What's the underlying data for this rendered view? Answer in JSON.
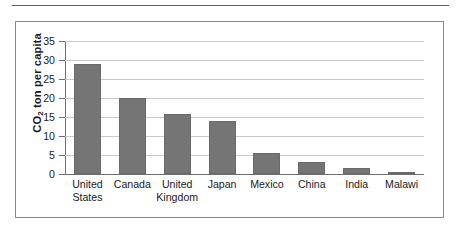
{
  "figure": {
    "y_axis_label_html": "CO2 ton per capita",
    "y_axis_label_main": "CO",
    "y_axis_label_sub": "2",
    "y_axis_label_rest": " ton per capita"
  },
  "chart_data": {
    "type": "bar",
    "title": "",
    "xlabel": "",
    "ylabel": "CO2 ton per capita",
    "ylim": [
      0,
      35
    ],
    "yticks": [
      0,
      5,
      10,
      15,
      20,
      25,
      30,
      35
    ],
    "ytick_labels": [
      "0",
      "5",
      "10",
      "15",
      "20",
      "25",
      "30",
      "35"
    ],
    "grid": true,
    "legend": "none",
    "categories": [
      "United States",
      "Canada",
      "United Kingdom",
      "Japan",
      "Mexico",
      "China",
      "India",
      "Malawi"
    ],
    "category_label_lines": [
      "United\nStates",
      "Canada",
      "United\nKingdom",
      "Japan",
      "Mexico",
      "China",
      "India",
      "Malawi"
    ],
    "values": [
      29.0,
      20.0,
      15.9,
      14.0,
      5.6,
      3.2,
      1.7,
      0.4
    ],
    "bar_color": "#757575",
    "gridline_color": "#c9c9c9",
    "axis_color": "#6d6d6d"
  }
}
